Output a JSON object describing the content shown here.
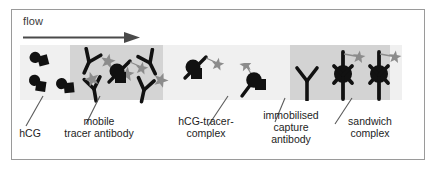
{
  "figure": {
    "flow_label": "flow",
    "frame_color": "#9a9a9a",
    "background_color": "#ffffff"
  },
  "strip": {
    "membrane_color": "#f0f0f0",
    "conjugate_pad_color": "#d4d4d4",
    "test_zone_color": "#d3d3d3",
    "molecule_color": "#111111",
    "label_color": "#7d7d7d"
  },
  "captions": [
    {
      "id": "hcg",
      "text": "hCG"
    },
    {
      "id": "mobile-tracer",
      "text": "mobile\ntracer antibody"
    },
    {
      "id": "hcg-tracer",
      "text": "hCG-tracer-\ncomplex"
    },
    {
      "id": "capture",
      "text": "immobilised\ncapture\nantibody"
    },
    {
      "id": "sandwich",
      "text": "sandwich\ncomplex"
    }
  ],
  "zones": {
    "sample": {
      "name": "sample zone",
      "contents": "free hCG analyte"
    },
    "conjugate": {
      "name": "conjugate pad",
      "contents": "mobile tracer antibody with label"
    },
    "transit": {
      "name": "transit zone",
      "contents": "hCG-tracer complexes"
    },
    "test": {
      "name": "test line zone",
      "contents": "immobilised capture antibody and sandwich complexes"
    }
  },
  "molecules": {
    "hcg": [
      {
        "x": 14,
        "y": 8,
        "rot": -15
      },
      {
        "x": 12,
        "y": 33,
        "rot": 10
      },
      {
        "x": 40,
        "y": 35,
        "rot": -5
      }
    ],
    "tracer_antibody": [
      {
        "x": 57,
        "y": 6,
        "rot": 22
      },
      {
        "x": 62,
        "y": 33,
        "rot": -8
      },
      {
        "x": 118,
        "y": 8,
        "rot": -28
      },
      {
        "x": 112,
        "y": 34,
        "rot": 14
      }
    ],
    "free_star": [
      {
        "x": 84,
        "y": 12,
        "rot": 12
      },
      {
        "x": 68,
        "y": 30,
        "rot": -20
      },
      {
        "x": 103,
        "y": 24,
        "rot": 5
      },
      {
        "x": 137,
        "y": 30,
        "rot": 18
      }
    ],
    "hcg_tracer_complex": [
      {
        "x": 90,
        "y": 18,
        "rot": 0
      },
      {
        "x": 165,
        "y": 10,
        "rot": 0
      },
      {
        "x": 212,
        "y": 26,
        "rot": 0
      }
    ],
    "capture_antibody": [
      {
        "x": 278,
        "y": 26,
        "rot": 0
      }
    ],
    "sandwich_complex": [
      {
        "x": 312,
        "y": 6,
        "rot": 0
      },
      {
        "x": 348,
        "y": 6,
        "rot": 0
      }
    ]
  }
}
